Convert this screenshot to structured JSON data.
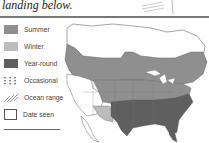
{
  "caption": "landing below.",
  "legend": {
    "items": [
      {
        "label": "Summer",
        "color": "#8f8f8f",
        "style": "fill"
      },
      {
        "label": "Winter",
        "color": "#bcbcbc",
        "style": "fill"
      },
      {
        "label": "Year-round",
        "color": "#5f5f5f",
        "style": "fill"
      },
      {
        "label": "Occasional",
        "color": "#888888",
        "style": "dots"
      },
      {
        "label": "Ocean range",
        "color": "#888888",
        "style": "hatch"
      },
      {
        "label": "Date seen",
        "color": "#ffffff",
        "style": "outline"
      }
    ]
  },
  "map": {
    "region": "North America range map",
    "colors": {
      "summer": "#8f8f8f",
      "winter": "#bcbcbc",
      "year_round": "#5f5f5f",
      "outline": "#666666",
      "land": "#ffffff"
    }
  }
}
